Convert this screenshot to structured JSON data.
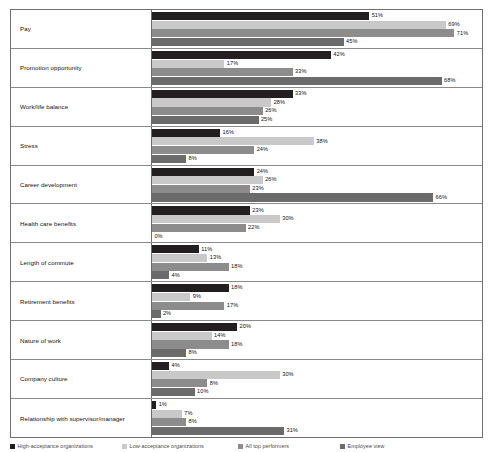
{
  "chart_data": {
    "type": "bar",
    "orientation": "horizontal",
    "title": "",
    "subtitle": "",
    "xlabel": "",
    "ylabel": "",
    "xlim": [
      0,
      71
    ],
    "grid": false,
    "legend_position": "bottom",
    "value_suffix": "%",
    "categories": [
      "Pay",
      "Promotion opportunity",
      "Work/life balance",
      "Stress",
      "Career development",
      "Health care benefits",
      "Length of commute",
      "Retirement benefits",
      "Nature of work",
      "Company culture",
      "Relationship with supervisor/manager"
    ],
    "series": [
      {
        "name": "High-acceptance organizations",
        "color": "#231f20",
        "values": [
          51,
          42,
          33,
          16,
          24,
          23,
          11,
          18,
          20,
          4,
          1
        ],
        "labels": [
          "51%",
          "42%",
          "33%",
          "16%",
          "24%",
          "23%",
          "11%",
          "18%",
          "20%",
          "4%",
          "1%"
        ]
      },
      {
        "name": "Low-acceptance organizations",
        "color": "#c9c9c9",
        "values": [
          69,
          17,
          28,
          38,
          26,
          30,
          13,
          9,
          14,
          30,
          7
        ],
        "labels": [
          "69%",
          "17%",
          "28%",
          "38%",
          "26%",
          "30%",
          "13%",
          "9%",
          "14%",
          "30%",
          "7%"
        ]
      },
      {
        "name": "All top performers",
        "color": "#8c8c8c",
        "values": [
          71,
          33,
          26,
          24,
          23,
          22,
          18,
          17,
          18,
          13,
          8
        ],
        "labels": [
          "71%",
          "33%",
          "26%",
          "24%",
          "23%",
          "22%",
          "18%",
          "17%",
          "18%",
          "8%",
          "8%"
        ]
      },
      {
        "name": "Employee view",
        "color": "#6b6b6b",
        "values": [
          45,
          68,
          25,
          8,
          66,
          0,
          4,
          2,
          8,
          10,
          31
        ],
        "labels": [
          "45%",
          "68%",
          "25%",
          "8%",
          "66%",
          "0%",
          "4%",
          "2%",
          "8%",
          "10%",
          "31%"
        ]
      }
    ]
  },
  "legend": {
    "items": [
      {
        "label": "High-acceptance organizations",
        "color": "#231f20"
      },
      {
        "label": "Low-acceptance organizations",
        "color": "#c9c9c9"
      },
      {
        "label": "All top performers",
        "color": "#8c8c8c"
      },
      {
        "label": "Employee view",
        "color": "#6b6b6b"
      }
    ]
  },
  "scale": {
    "px_per_percent": 4.26,
    "bar_origin_px": 0
  }
}
